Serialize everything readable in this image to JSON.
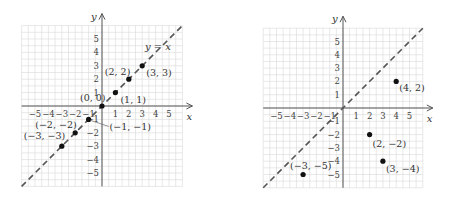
{
  "chart_data": [
    {
      "type": "scatter",
      "title": "",
      "xlabel": "x",
      "ylabel": "y",
      "xlim": [
        -6,
        6
      ],
      "ylim": [
        -6,
        6
      ],
      "grid": true,
      "x_ticks": [
        -5,
        -4,
        -3,
        -2,
        -1,
        1,
        2,
        3,
        4,
        5
      ],
      "y_ticks": [
        -5,
        -4,
        -3,
        -2,
        -1,
        1,
        2,
        3,
        4,
        5
      ],
      "x_tick_labels": [
        "−5",
        "−4",
        "−3",
        "−2",
        "−1",
        "1",
        "2",
        "3",
        "4",
        "5"
      ],
      "y_tick_labels": [
        "−5",
        "−4",
        "−3",
        "−2",
        "−1",
        "1",
        "2",
        "3",
        "4",
        "5"
      ],
      "line": {
        "label": "y = x",
        "style": "dashed",
        "slope": 1,
        "intercept": 0
      },
      "points": [
        {
          "x": -3,
          "y": -3,
          "label": "(−3, −3)"
        },
        {
          "x": -2,
          "y": -2,
          "label": "(−2, −2)"
        },
        {
          "x": -1,
          "y": -1,
          "label": "(−1, −1)"
        },
        {
          "x": 0,
          "y": 0,
          "label": "(0, 0)"
        },
        {
          "x": 1,
          "y": 1,
          "label": "(1, 1)"
        },
        {
          "x": 2,
          "y": 2,
          "label": "(2, 2)"
        },
        {
          "x": 3,
          "y": 3,
          "label": "(3, 3)"
        }
      ]
    },
    {
      "type": "scatter",
      "title": "",
      "xlabel": "x",
      "ylabel": "y",
      "xlim": [
        -6,
        6
      ],
      "ylim": [
        -6,
        6
      ],
      "grid": true,
      "x_ticks": [
        -5,
        -4,
        -3,
        -2,
        -1,
        1,
        2,
        3,
        4,
        5
      ],
      "y_ticks": [
        -5,
        -4,
        -3,
        -2,
        -1,
        1,
        2,
        3,
        4,
        5
      ],
      "x_tick_labels": [
        "−5",
        "−4",
        "−3",
        "−2",
        "−1",
        "1",
        "2",
        "3",
        "4",
        "5"
      ],
      "y_tick_labels": [
        "−5",
        "−4",
        "−3",
        "−2",
        "−1",
        "1",
        "2",
        "3",
        "4",
        "5"
      ],
      "line": {
        "label": "",
        "style": "dashed",
        "slope": 1,
        "intercept": 0
      },
      "points": [
        {
          "x": 4,
          "y": 2,
          "label": "(4, 2)"
        },
        {
          "x": 2,
          "y": -2,
          "label": "(2, −2)"
        },
        {
          "x": 3,
          "y": -4,
          "label": "(3, −4)"
        },
        {
          "x": -3,
          "y": -5,
          "label": "(−3, −5)"
        }
      ]
    }
  ]
}
